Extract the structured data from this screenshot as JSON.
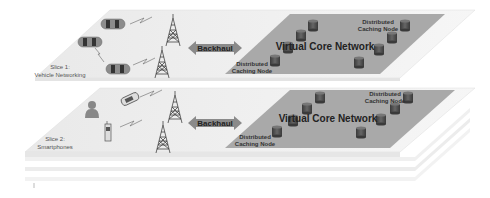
{
  "diagram": {
    "type": "network-slicing-layers",
    "slices": [
      {
        "id": "slice1",
        "title": "Slice 1:",
        "subtitle": "Vehicle Networking",
        "backhaul_label": "Backhaul",
        "core_label": "Virtual Core Network",
        "caching_node_label_top": "Distributed",
        "caching_node_label_bottom": "Caching Node",
        "devices": [
          "car",
          "car",
          "car"
        ],
        "towers": 2
      },
      {
        "id": "slice2",
        "title": "Slice 2:",
        "subtitle": "Smartphones",
        "backhaul_label": "Backhaul",
        "core_label": "Virtual Core Network",
        "caching_node_label_top": "Distributed",
        "caching_node_label_bottom": "Caching Node",
        "devices": [
          "user",
          "flip-phone",
          "mobile-phone"
        ],
        "towers": 2
      }
    ],
    "colors": {
      "slice_plane": "#efefef",
      "core_plane": "#a8a8a8",
      "cylinder": "#4a4a4a",
      "arrow": "#8a8a8a",
      "car_body": "#888888"
    }
  }
}
